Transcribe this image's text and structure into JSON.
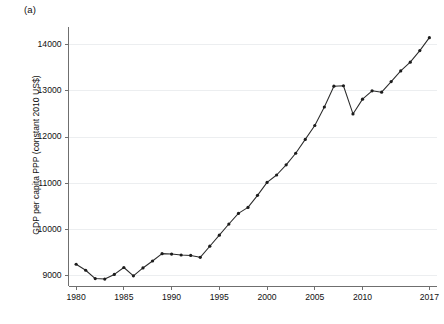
{
  "figure": {
    "panel_label": "(a)",
    "background_color": "#ffffff",
    "line_color": "#2b2b2b",
    "grid_color": "#eceef0",
    "axis_color": "#6f6f6f"
  },
  "chart_data": {
    "type": "line",
    "title": "",
    "subtitle": "",
    "panel_label": "(a)",
    "xlabel": "",
    "ylabel": "GDP per capita PPP (constant 2010 US$)",
    "xlim": [
      1979.2,
      2017.8
    ],
    "ylim": [
      8780,
      14380
    ],
    "grid": "horizontal",
    "legend": "none",
    "markers": true,
    "marker_shape": "circle",
    "xticks": [
      1980,
      1985,
      1990,
      1995,
      2000,
      2005,
      2010,
      2017
    ],
    "xtick_labels": [
      "1980",
      "1985",
      "1990",
      "1995",
      "2000",
      "2005",
      "2010",
      "2017"
    ],
    "yticks": [
      9000,
      10000,
      11000,
      12000,
      13000,
      14000
    ],
    "ytick_labels": [
      "9000",
      "10000",
      "11000",
      "12000",
      "13000",
      "14000"
    ],
    "series": [
      {
        "name": "GDP per capita PPP (constant 2010 US$)",
        "x": [
          1980,
          1981,
          1982,
          1983,
          1984,
          1985,
          1986,
          1987,
          1988,
          1989,
          1990,
          1991,
          1992,
          1993,
          1994,
          1995,
          1996,
          1997,
          1998,
          1999,
          2000,
          2001,
          2002,
          2003,
          2004,
          2005,
          2006,
          2007,
          2008,
          2009,
          2010,
          2011,
          2012,
          2013,
          2014,
          2015,
          2016,
          2017
        ],
        "values": [
          9250,
          9120,
          8940,
          8930,
          9030,
          9180,
          9000,
          9170,
          9320,
          9480,
          9470,
          9450,
          9440,
          9400,
          9640,
          9880,
          10120,
          10350,
          10480,
          10740,
          11020,
          11180,
          11400,
          11650,
          11950,
          12250,
          12650,
          13100,
          13110,
          12500,
          12820,
          13000,
          12970,
          13200,
          13430,
          13620,
          13870,
          14150
        ]
      }
    ]
  }
}
